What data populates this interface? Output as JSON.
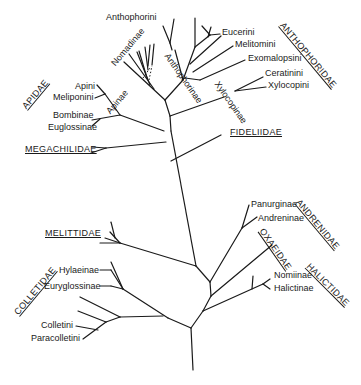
{
  "diagram": {
    "type": "phylogenetic-tree",
    "families": {
      "anthophoridae": "ANTHOPHORIDAE",
      "apidae": "APIDAE",
      "fideliidae": "FIDELIIDAE",
      "megachilidae": "MEGACHILIDAE",
      "andrenidae": "ANDRENIDAE",
      "oxaeidae": "OXAEIDAE",
      "halictidae": "HALICTIDAE",
      "melittidae": "MELITTIDAE",
      "colletidae": "COLLETIDAE"
    },
    "subfamilies": {
      "nomadinae": "Nomadinae",
      "anthophorinae": "Anthophorinae",
      "xylocopinae": "Xylocopinae",
      "apinae": "Apinae",
      "panurginae": "Panurginae",
      "andreninae": "Andreninae",
      "nomiinae": "Nomiinae",
      "halictinae": "Halictinae",
      "hylaeinae": "Hylaeinae",
      "euryglossinae": "Euryglossinae",
      "bombinae": "Bombinae",
      "euglossinae": "Euglossinae"
    },
    "tribes": {
      "anthophorini": "Anthophorini",
      "eucerini": "Eucerini",
      "melitomini": "Melitomini",
      "exomalopsini": "Exomalopsini",
      "ceratinini": "Ceratinini",
      "xylocopini": "Xylocopini",
      "apini": "Apini",
      "meliponini": "Meliponini",
      "colletini": "Colletini",
      "paracolletini": "Paracolletini"
    }
  }
}
